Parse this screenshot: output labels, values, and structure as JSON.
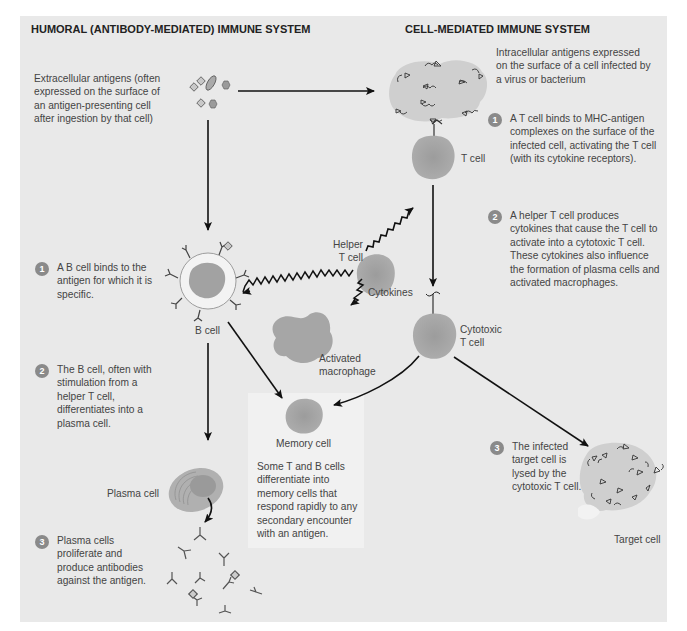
{
  "humoral": {
    "heading": "HUMORAL (ANTIBODY-MEDIATED) IMMUNE SYSTEM",
    "intro": "Extracellular antigens (often expressed on the surface of an antigen-presenting cell after ingestion by that cell)",
    "steps": [
      {
        "num": "1",
        "text": "A B cell binds to the antigen for which it is specific."
      },
      {
        "num": "2",
        "text": "The B cell, often with stimulation from a helper T cell, differentiates into a plasma cell."
      },
      {
        "num": "3",
        "text": "Plasma cells proliferate and produce antibodies against the antigen."
      }
    ],
    "labels": {
      "b_cell": "B cell",
      "plasma_cell": "Plasma cell"
    }
  },
  "cell_mediated": {
    "heading": "CELL-MEDIATED IMMUNE SYSTEM",
    "intro": "Intracellular antigens expressed on the surface of a cell infected by a virus or bacterium",
    "steps": [
      {
        "num": "1",
        "text": "A T cell binds to MHC-antigen complexes on the surface of the infected cell, activating the T cell (with its cytokine receptors)."
      },
      {
        "num": "2",
        "text": "A helper T cell produces cytokines that cause the T cell to activate into a cytotoxic T cell. These cytokines also influence the formation of plasma cells and activated macrophages."
      },
      {
        "num": "3",
        "text": "The infected target cell is lysed by the cytotoxic T cell."
      }
    ],
    "labels": {
      "t_cell": "T cell",
      "helper_t_cell": "Helper T cell",
      "cytokines": "Cytokines",
      "cytotoxic_t_cell": "Cytotoxic T cell",
      "target_cell": "Target cell"
    }
  },
  "shared": {
    "labels": {
      "activated_macrophage": "Activated macrophage",
      "memory_cell": "Memory cell"
    },
    "memory_note": "Some T and B cells differentiate into memory cells that respond rapidly to any secondary encounter with an antigen."
  },
  "colors": {
    "panel": "#e9e9e9",
    "cell_fill": "#a9a9a9",
    "infected_cell_fill": "#cfcfcf",
    "arrow": "#111111",
    "step_badge": "#8a8a8a"
  }
}
